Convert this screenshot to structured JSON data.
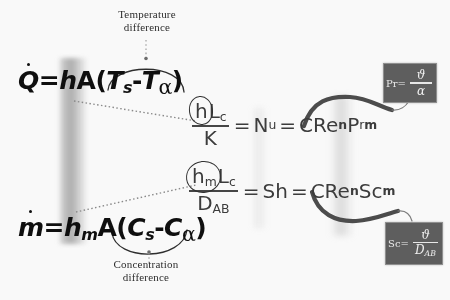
{
  "diagram": {
    "background_color": "#fdfdfd"
  },
  "labels": {
    "temperature_difference": "Temperature\ndifference",
    "temperature_difference_line1": "Temperature",
    "temperature_difference_line2": "difference",
    "concentration_difference_line1": "Concentration",
    "concentration_difference_line2": "difference"
  },
  "equations": {
    "heat_rate": {
      "name": "heat-transfer-rate",
      "lhs": "Q",
      "lhs_accent": "dot",
      "coefficient": "h",
      "area": "A",
      "open_paren": "(",
      "term1": "T",
      "term1_sub": "s",
      "minus": "-",
      "term2": "T",
      "term2_sub": "α",
      "close_paren": ")",
      "plain": "Q̇ = hA(T_s - T_α)"
    },
    "mass_rate": {
      "name": "mass-transfer-rate",
      "lhs": "m",
      "lhs_accent": "dot",
      "coefficient": "h",
      "coefficient_sub": "m",
      "area": "A",
      "open_paren": "(",
      "term1": "C",
      "term1_sub": "s",
      "minus": "-",
      "term2": "C",
      "term2_sub": "α",
      "close_paren": ")",
      "plain": "ṁ = h_m A(C_s - C_α)"
    },
    "nusselt": {
      "name": "nusselt-correlation",
      "num_h": "h",
      "num_L": "L",
      "num_L_sub": "c",
      "den": "K",
      "eq1": "=",
      "nu": "N",
      "nu_sub": "u",
      "eq2": "=",
      "c": "C",
      "re": "Re",
      "re_sup": "n",
      "pr": "P",
      "pr_sub": "r",
      "pr_sup": "m",
      "plain": "hL_c / K = N_u = C Re^n P_r^m"
    },
    "sherwood": {
      "name": "sherwood-correlation",
      "num_h": "h",
      "num_h_sub": "m",
      "num_L": "L",
      "num_L_sub": "c",
      "den": "D",
      "den_sub": "AB",
      "eq1": "=",
      "sh": "Sh",
      "eq2": "=",
      "c": "C",
      "re": "Re",
      "re_sup": "n",
      "sc": "Sc",
      "sc_sup": "m",
      "plain": "h_m L_c / D_AB = Sh = C Re^n Sc^m"
    }
  },
  "boxes": {
    "prandtl": {
      "name": "prandtl-number-box",
      "lead": "Pr=",
      "numerator": "ϑ",
      "denominator": "α",
      "plain": "Pr = ϑ/α",
      "fill_color": "#5d5d5d",
      "text_color": "#f2f2f2"
    },
    "schmidt": {
      "name": "schmidt-number-box",
      "lead": "Sc=",
      "numerator": "ϑ",
      "denominator": "D",
      "denominator_sub": "AB",
      "plain": "Sc = ϑ/D_AB",
      "fill_color": "#5d5d5d",
      "text_color": "#f2f2f2"
    }
  },
  "annotations": {
    "arc_top": "brace-over-temperature-difference",
    "arc_bottom": "brace-under-concentration-difference",
    "leader_top": "dotted-leader-temperature",
    "leader_bottom": "dotted-leader-concentration",
    "link_h_to_nusselt": "dotted-link-h-coefficient",
    "link_hm_to_sherwood": "dotted-link-hm-coefficient",
    "ribbon_prandtl": "curved-ribbon-to-prandtl-box",
    "ribbon_schmidt": "curved-ribbon-to-schmidt-box",
    "circle_h": "circled-h-annotation",
    "circle_hm": "circled-hm-annotation"
  },
  "colors": {
    "ink": "#0c0c0c",
    "gray_ink": "#3a3a3a",
    "box_fill": "#5d5d5d",
    "ribbon": "#4a4a4a",
    "dotted": "#8a8a8a"
  }
}
